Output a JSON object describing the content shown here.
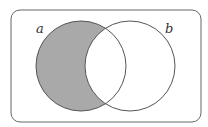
{
  "diagram": {
    "type": "venn",
    "universe": {
      "x": 11,
      "y": 10,
      "width": 190,
      "height": 112,
      "corner_radius": 9
    },
    "sets": [
      {
        "id": "a",
        "label": "a",
        "cx": 81,
        "cy": 66,
        "r": 45,
        "label_x": 36,
        "label_y": 33
      },
      {
        "id": "b",
        "label": "b",
        "cx": 130,
        "cy": 66,
        "r": 45,
        "label_x": 165,
        "label_y": 33
      }
    ],
    "shaded_region": "a minus b",
    "colors": {
      "shade": "#a9a9a9",
      "stroke": "#555555",
      "frame": "#666666",
      "background": "#ffffff"
    }
  }
}
